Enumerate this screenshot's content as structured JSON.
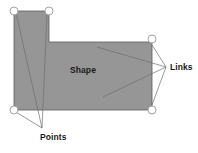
{
  "figure": {
    "type": "annotated-shape-diagram",
    "background_color": "#ffffff",
    "width": 198,
    "height": 153
  },
  "shape": {
    "name": "gray-polygon",
    "fill_color": "#969696",
    "stroke_color": "#5a5a5a",
    "stroke_width": 0.8,
    "outline_points": "14,11 49,11 49,42 152,42 152,110 14,110",
    "description": "L-shaped / stepped polygon"
  },
  "labels": {
    "shape": "Shape",
    "links": "Links",
    "points": "Points"
  },
  "label_positions": {
    "shape": {
      "x": 83,
      "y": 73
    },
    "links": {
      "x": 172,
      "y": 67
    },
    "points": {
      "x": 40,
      "y": 138
    }
  },
  "handles": {
    "name": "selection-handles",
    "fill_color": "#ffffff",
    "stroke_color": "#9a9a9a",
    "radius": 4,
    "items": [
      {
        "id": "handle-top-left",
        "x": 14,
        "y": 11
      },
      {
        "id": "handle-top-right",
        "x": 49,
        "y": 11
      },
      {
        "id": "handle-mid-right-top",
        "x": 152,
        "y": 39
      },
      {
        "id": "handle-bottom-left",
        "x": 14,
        "y": 110
      },
      {
        "id": "handle-bottom-right",
        "x": 152,
        "y": 110
      }
    ]
  },
  "leader_lines": {
    "stroke_color": "#6e6e6e",
    "stroke_width": 0.7,
    "points_callout": {
      "target": {
        "x": 42,
        "y": 128
      },
      "from": [
        {
          "x": 16,
          "y": 13
        },
        {
          "x": 47,
          "y": 13
        },
        {
          "x": 16,
          "y": 112
        }
      ]
    },
    "links_callout": {
      "target": {
        "x": 166,
        "y": 67
      },
      "from": [
        {
          "x": 97,
          "y": 47
        },
        {
          "x": 103,
          "y": 97
        }
      ]
    }
  },
  "legend": {
    "shape_meaning": "filled polygon region",
    "points_meaning": "corner vertex handles",
    "links_meaning": "edge segments between points"
  }
}
